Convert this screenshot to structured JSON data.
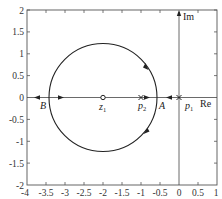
{
  "diagram": {
    "type": "root-locus",
    "axes": {
      "x_label": "Re",
      "y_label": "Im",
      "x_range": [
        -4,
        1
      ],
      "y_range": [
        -2,
        2
      ],
      "x_ticks": [
        "-4",
        "-3.5",
        "-3",
        "-2.5",
        "-2",
        "-1.5",
        "-1",
        "-0.5",
        "0",
        "0.5",
        "1"
      ],
      "y_ticks": [
        "2",
        "1.5",
        "1",
        "0.5",
        "0",
        "-0.5",
        "-1",
        "-1.5",
        "-2"
      ]
    },
    "points": {
      "zero_z1": {
        "label": "z",
        "sub": "1",
        "re": -2,
        "im": 0,
        "marker": "circle"
      },
      "pole_p2": {
        "label": "p",
        "sub": "2",
        "re": -1,
        "im": 0,
        "marker": "cross"
      },
      "pole_p1": {
        "label": "p",
        "sub": "1",
        "re": 0,
        "im": 0,
        "marker": "cross"
      },
      "breakaway_A": {
        "label": "A",
        "re": -0.59,
        "im": 0
      },
      "breakin_B": {
        "label": "B",
        "re": -3.41,
        "im": 0
      }
    },
    "circle": {
      "center_re": -2,
      "center_im": 0,
      "radius": 1.414
    },
    "colors": {
      "line": "#222222",
      "frame": "#555555",
      "text": "#333333"
    }
  }
}
